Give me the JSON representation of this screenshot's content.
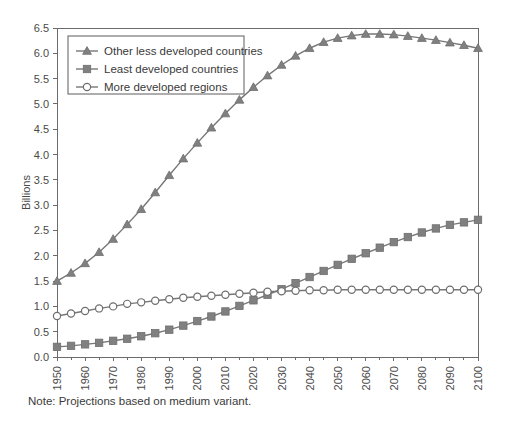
{
  "note": "Note: Projections based on medium variant.",
  "chart_data": {
    "type": "line",
    "title": "",
    "xlabel": "",
    "ylabel": "Billions",
    "xlim": [
      1950,
      2100
    ],
    "ylim": [
      0.0,
      6.5
    ],
    "grid": false,
    "legend_position": "top-left",
    "xticks": [
      1950,
      1960,
      1970,
      1980,
      1990,
      2000,
      2010,
      2020,
      2030,
      2040,
      2050,
      2060,
      2070,
      2080,
      2090,
      2100
    ],
    "xtick_labels": [
      "1950",
      "1960",
      "1970",
      "1980",
      "1990",
      "2000",
      "2010",
      "2020",
      "2030",
      "2040",
      "2050",
      "2060",
      "2070",
      "2080",
      "2090",
      "2100"
    ],
    "yticks": [
      0.0,
      0.5,
      1.0,
      1.5,
      2.0,
      2.5,
      3.0,
      3.5,
      4.0,
      4.5,
      5.0,
      5.5,
      6.0,
      6.5
    ],
    "ytick_labels": [
      "0.0",
      "0.5",
      "1.0",
      "1.5",
      "2.0",
      "2.5",
      "3.0",
      "3.5",
      "4.0",
      "4.5",
      "5.0",
      "5.5",
      "6.0",
      "6.5"
    ],
    "x": [
      1950,
      1955,
      1960,
      1965,
      1970,
      1975,
      1980,
      1985,
      1990,
      1995,
      2000,
      2005,
      2010,
      2015,
      2020,
      2025,
      2030,
      2035,
      2040,
      2045,
      2050,
      2055,
      2060,
      2065,
      2070,
      2075,
      2080,
      2085,
      2090,
      2095,
      2100
    ],
    "series": [
      {
        "name": "Other less developed countries",
        "marker": "triangle",
        "color": "#808080",
        "values": [
          1.5,
          1.66,
          1.85,
          2.07,
          2.33,
          2.62,
          2.92,
          3.25,
          3.59,
          3.92,
          4.23,
          4.53,
          4.81,
          5.08,
          5.33,
          5.56,
          5.77,
          5.95,
          6.1,
          6.22,
          6.3,
          6.35,
          6.38,
          6.38,
          6.37,
          6.34,
          6.3,
          6.26,
          6.21,
          6.16,
          6.1
        ]
      },
      {
        "name": "Least developed countries",
        "marker": "square",
        "color": "#808080",
        "values": [
          0.2,
          0.22,
          0.25,
          0.28,
          0.32,
          0.36,
          0.41,
          0.47,
          0.54,
          0.62,
          0.71,
          0.8,
          0.9,
          1.01,
          1.12,
          1.23,
          1.34,
          1.46,
          1.58,
          1.7,
          1.82,
          1.94,
          2.05,
          2.16,
          2.27,
          2.37,
          2.46,
          2.54,
          2.61,
          2.66,
          2.71
        ]
      },
      {
        "name": "More developed regions",
        "marker": "circle",
        "color": "#808080",
        "values": [
          0.81,
          0.86,
          0.91,
          0.96,
          1.0,
          1.05,
          1.08,
          1.11,
          1.14,
          1.17,
          1.19,
          1.21,
          1.23,
          1.25,
          1.27,
          1.29,
          1.3,
          1.31,
          1.32,
          1.32,
          1.33,
          1.33,
          1.33,
          1.33,
          1.33,
          1.33,
          1.33,
          1.33,
          1.33,
          1.33,
          1.33
        ]
      }
    ]
  }
}
